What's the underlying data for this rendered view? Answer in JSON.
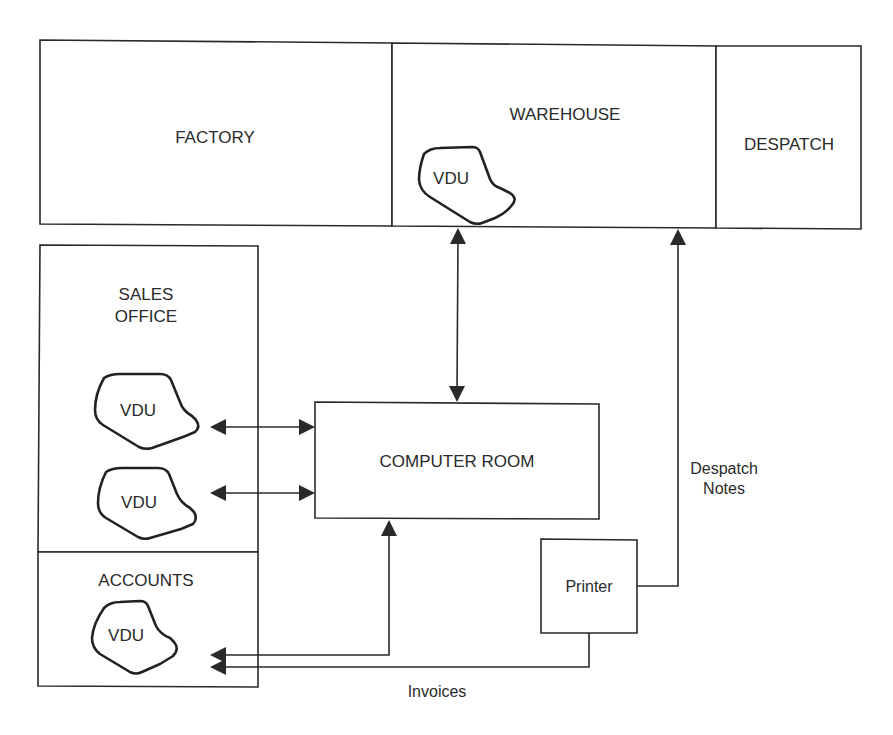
{
  "diagram": {
    "type": "system-layout",
    "areas": {
      "factory": "FACTORY",
      "warehouse": "WAREHOUSE",
      "despatch": "DESPATCH",
      "sales_office_line1": "SALES",
      "sales_office_line2": "OFFICE",
      "accounts": "ACCOUNTS",
      "computer_room": "COMPUTER ROOM",
      "printer": "Printer"
    },
    "terminals": {
      "warehouse_vdu": "VDU",
      "sales_vdu_1": "VDU",
      "sales_vdu_2": "VDU",
      "accounts_vdu": "VDU"
    },
    "flows": {
      "despatch_notes_line1": "Despatch",
      "despatch_notes_line2": "Notes",
      "invoices": "Invoices"
    },
    "connections": [
      {
        "from": "Warehouse VDU",
        "to": "Computer Room",
        "direction": "both"
      },
      {
        "from": "Sales VDU 1",
        "to": "Computer Room",
        "direction": "both"
      },
      {
        "from": "Sales VDU 2",
        "to": "Computer Room",
        "direction": "both"
      },
      {
        "from": "Computer Room",
        "to": "Accounts VDU",
        "direction": "both"
      },
      {
        "from": "Printer",
        "to": "Despatch",
        "label": "Despatch Notes"
      },
      {
        "from": "Printer",
        "to": "Accounts VDU",
        "label": "Invoices"
      }
    ]
  }
}
